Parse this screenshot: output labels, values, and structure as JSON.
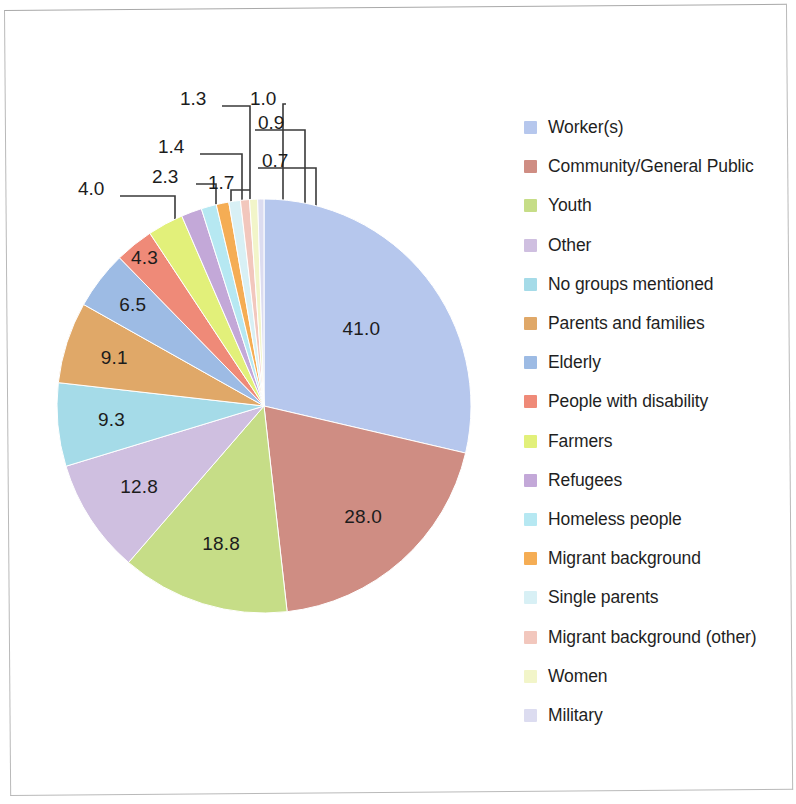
{
  "chart_data": {
    "type": "pie",
    "title": "",
    "subtitle": "",
    "xlabel": "",
    "ylabel": "",
    "legend_position": "right",
    "grid": false,
    "note": "Percentages are multiple-response shares; slice angles are proportional to the values.",
    "categories": [
      "Worker(s)",
      "Community/General Public",
      "Youth",
      "Other",
      "No groups mentioned",
      "Parents and families",
      "Elderly",
      "People with disability",
      "Farmers",
      "Refugees",
      "Homeless people",
      "Migrant background",
      "Single parents",
      "Migrant background (other)",
      "Women",
      "Military"
    ],
    "values": [
      41.0,
      28.0,
      18.8,
      12.8,
      9.3,
      9.1,
      6.5,
      4.3,
      4.0,
      2.3,
      1.7,
      1.4,
      1.3,
      1.0,
      0.9,
      0.7
    ],
    "value_labels": [
      "41.0",
      "28.0",
      "18.8",
      "12.8",
      "9.3",
      "9.1",
      "6.5",
      "4.3",
      "4.0",
      "2.3",
      "1.7",
      "1.4",
      "1.3",
      "1.0",
      "0.9",
      "0.7"
    ],
    "colors": [
      "#b6c7ed",
      "#cf8d83",
      "#c6dd87",
      "#cfbfe0",
      "#a5dbe8",
      "#e0a868",
      "#9dbbe4",
      "#ef8a78",
      "#e2f07a",
      "#c3a8d8",
      "#b6e8f2",
      "#f5ad54",
      "#d8f0f5",
      "#f2c7bd",
      "#f2f5c9",
      "#dcdcf0"
    ]
  },
  "legend": {
    "items": [
      {
        "label": "Worker(s)",
        "color": "#b6c7ed"
      },
      {
        "label": "Community/General Public",
        "color": "#cf8d83"
      },
      {
        "label": "Youth",
        "color": "#c6dd87"
      },
      {
        "label": "Other",
        "color": "#cfbfe0"
      },
      {
        "label": "No groups mentioned",
        "color": "#a5dbe8"
      },
      {
        "label": "Parents and families",
        "color": "#e0a868"
      },
      {
        "label": "Elderly",
        "color": "#9dbbe4"
      },
      {
        "label": "People with disability",
        "color": "#ef8a78"
      },
      {
        "label": "Farmers",
        "color": "#e2f07a"
      },
      {
        "label": "Refugees",
        "color": "#c3a8d8"
      },
      {
        "label": "Homeless people",
        "color": "#b6e8f2"
      },
      {
        "label": "Migrant background",
        "color": "#f5ad54"
      },
      {
        "label": "Single parents",
        "color": "#d8f0f5"
      },
      {
        "label": "Migrant background (other)",
        "color": "#f2c7bd"
      },
      {
        "label": "Women",
        "color": "#f2f5c9"
      },
      {
        "label": "Military",
        "color": "#dcdcf0"
      }
    ]
  }
}
